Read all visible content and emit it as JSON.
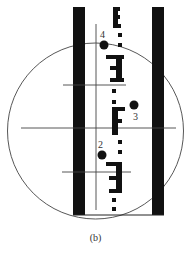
{
  "figure": {
    "caption": "(b)",
    "colors": {
      "ink": "#111111",
      "line": "#444444",
      "background": "#ffffff"
    },
    "points": [
      {
        "id": "4",
        "label": "4"
      },
      {
        "id": "3",
        "label": "3"
      },
      {
        "id": "2",
        "label": "2"
      }
    ]
  }
}
